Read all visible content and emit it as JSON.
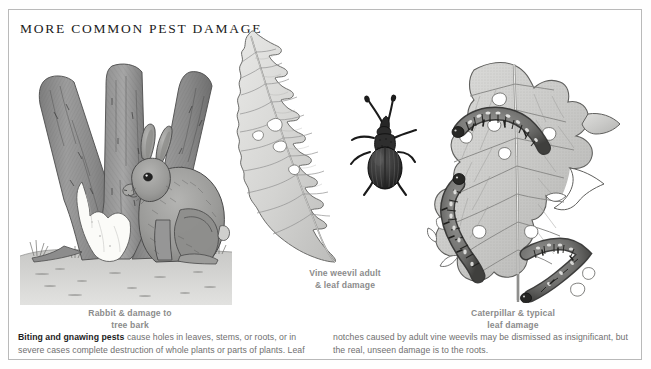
{
  "plate": {
    "title": "MORE COMMON PEST DAMAGE",
    "border_color": "#b9b9b9",
    "background_color": "#ffffff",
    "caption_color": "#8c8c8c",
    "body_color": "#6f6f6f",
    "lead_color": "#1d1d1d"
  },
  "figures": [
    {
      "id": "rabbit-tree",
      "caption_line1": "Rabbit & damage to",
      "caption_line2": "tree bark",
      "subject": "rabbit beside multi-trunked tree with bark stripped",
      "elements": [
        "tree-trunks",
        "stripped-bark-patch",
        "rabbit",
        "grass-ground"
      ]
    },
    {
      "id": "vine-weevil",
      "caption_line1": "Vine weevil adult",
      "caption_line2": "& leaf damage",
      "subject": "notched leaf with adult vine weevil beetle",
      "elements": [
        "notched-leaf",
        "weevil-beetle"
      ]
    },
    {
      "id": "caterpillar-leaf",
      "caption_line1": "Caterpillar & typical",
      "caption_line2": "leaf damage",
      "subject": "leaf with holes and three caterpillars feeding",
      "elements": [
        "chewed-leaf",
        "caterpillar-top",
        "caterpillar-left",
        "caterpillar-bottom",
        "leaf-holes"
      ]
    }
  ],
  "body": {
    "lead": "Biting and gnawing pests",
    "rest": " cause holes in leaves, stems, or roots, or in severe cases complete destruction of whole plants or parts of plants. Leaf notches caused by adult vine weevils may be dismissed as insignificant, but the real, unseen damage is to the roots."
  }
}
